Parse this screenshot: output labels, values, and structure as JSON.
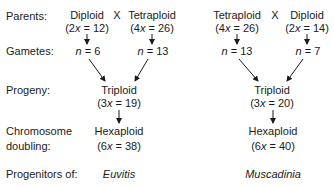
{
  "row_labels": {
    "parents": "Parents:",
    "gametes": "Gametes:",
    "progeny": "Progeny:",
    "doubling_line1": "Chromosome",
    "doubling_line2": "doubling:",
    "progenitors": "Progenitors of:"
  },
  "cross_symbol": "X",
  "left_cross": {
    "parent_a": {
      "name": "Diploid",
      "formula": "(2x = 12)",
      "formula_pre": "(2",
      "formula_x": "x",
      "formula_post": " = 12)",
      "gamete_n": "n",
      "gamete_val": " = 6"
    },
    "parent_b": {
      "name": "Tetraploid",
      "formula_pre": "(4",
      "formula_x": "x",
      "formula_post": " = 26)",
      "gamete_n": "n",
      "gamete_val": " = 13"
    },
    "progeny": {
      "name": "Triploid",
      "formula_pre": "(3",
      "formula_x": "x",
      "formula_post": " = 19)"
    },
    "doubled": {
      "name": "Hexaploid",
      "formula_pre": "(6",
      "formula_x": "x",
      "formula_post": " = 38)"
    },
    "progenitor_of": "Euvitis"
  },
  "right_cross": {
    "parent_a": {
      "name": "Tetraploid",
      "formula_pre": "(4",
      "formula_x": "x",
      "formula_post": " = 26)",
      "gamete_n": "n",
      "gamete_val": " = 13"
    },
    "parent_b": {
      "name": "Diploid",
      "formula_pre": "(2",
      "formula_x": "x",
      "formula_post": " = 14)",
      "gamete_n": "n",
      "gamete_val": " = 7"
    },
    "progeny": {
      "name": "Triploid",
      "formula_pre": "(3",
      "formula_x": "x",
      "formula_post": " = 20)"
    },
    "doubled": {
      "name": "Hexaploid",
      "formula_pre": "(6",
      "formula_x": "x",
      "formula_post": " = 40)"
    },
    "progenitor_of": "Muscadinia"
  },
  "colors": {
    "text": "#1a1a1a",
    "arrow": "#1a1a1a",
    "background": "#ffffff"
  }
}
